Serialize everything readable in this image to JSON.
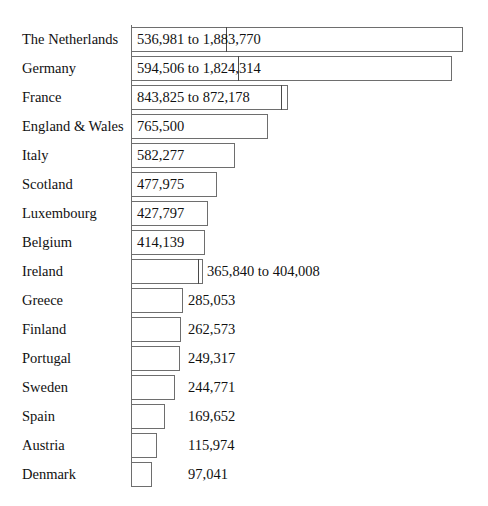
{
  "chart_data": {
    "type": "bar",
    "orientation": "horizontal",
    "title": "",
    "subtitle": "",
    "xlabel": "",
    "ylabel": "",
    "grid": false,
    "legend": null,
    "axis": {
      "category_axis": "left",
      "tick_labels": [],
      "value_axis_visible": false
    },
    "note": "Each row is a country. Some rows encode a range (lower to upper bound) drawn as an inner divider line plus an outer bar edge; others encode one single value.",
    "categories": [
      "The Netherlands",
      "Germany",
      "France",
      "England & Wales",
      "Italy",
      "Scotland",
      "Luxembourg",
      "Belgium",
      "Ireland",
      "Greece",
      "Finland",
      "Portugal",
      "Sweden",
      "Spain",
      "Austria",
      "Denmark"
    ],
    "values": [
      1883770,
      1824314,
      872178,
      765500,
      582277,
      477975,
      427797,
      414139,
      404008,
      285053,
      262573,
      249317,
      244771,
      169652,
      115974,
      97041
    ],
    "values_lower": [
      536981,
      594506,
      843825,
      null,
      null,
      null,
      null,
      null,
      365840,
      null,
      null,
      null,
      null,
      null,
      null,
      null
    ],
    "series": [
      {
        "name": "Upper bound / value",
        "values": [
          1883770,
          1824314,
          872178,
          765500,
          582277,
          477975,
          427797,
          414139,
          404008,
          285053,
          262573,
          249317,
          244771,
          169652,
          115974,
          97041
        ]
      },
      {
        "name": "Lower bound",
        "values": [
          536981,
          594506,
          843825,
          null,
          null,
          null,
          null,
          null,
          365840,
          null,
          null,
          null,
          null,
          null,
          null,
          null
        ]
      }
    ]
  },
  "rows": [
    {
      "country": "The Netherlands",
      "label": "536,981 to 1,883,770",
      "label_position": "inside",
      "is_range": true,
      "outer_px": 332,
      "inner_px": 95,
      "label_left_px": 137
    },
    {
      "country": "Germany",
      "label": "594,506 to 1,824,314",
      "label_position": "inside",
      "is_range": true,
      "outer_px": 321,
      "inner_px": 107,
      "label_left_px": 137
    },
    {
      "country": "France",
      "label": "843,825 to 872,178",
      "label_position": "inside",
      "is_range": true,
      "outer_px": 157,
      "inner_px": 150,
      "label_left_px": 137
    },
    {
      "country": "England & Wales",
      "label": "765,500",
      "label_position": "inside",
      "is_range": false,
      "outer_px": 137,
      "inner_px": null,
      "label_left_px": 137
    },
    {
      "country": "Italy",
      "label": "582,277",
      "label_position": "inside",
      "is_range": false,
      "outer_px": 104,
      "inner_px": null,
      "label_left_px": 137
    },
    {
      "country": "Scotland",
      "label": "477,975",
      "label_position": "inside",
      "is_range": false,
      "outer_px": 86,
      "inner_px": null,
      "label_left_px": 137
    },
    {
      "country": "Luxembourg",
      "label": "427,797",
      "label_position": "inside",
      "is_range": false,
      "outer_px": 77,
      "inner_px": null,
      "label_left_px": 137
    },
    {
      "country": "Belgium",
      "label": "414,139",
      "label_position": "inside",
      "is_range": false,
      "outer_px": 74,
      "inner_px": null,
      "label_left_px": 137
    },
    {
      "country": "Ireland",
      "label": "365,840 to 404,008",
      "label_position": "outside",
      "is_range": true,
      "outer_px": 72,
      "inner_px": 67,
      "label_left_px": 207
    },
    {
      "country": "Greece",
      "label": "285,053",
      "label_position": "outside",
      "is_range": false,
      "outer_px": 52,
      "inner_px": null,
      "label_left_px": 188
    },
    {
      "country": "Finland",
      "label": "262,573",
      "label_position": "outside",
      "is_range": false,
      "outer_px": 50,
      "inner_px": null,
      "label_left_px": 188
    },
    {
      "country": "Portugal",
      "label": "249,317",
      "label_position": "outside",
      "is_range": false,
      "outer_px": 49,
      "inner_px": null,
      "label_left_px": 188
    },
    {
      "country": "Sweden",
      "label": "244,771",
      "label_position": "outside",
      "is_range": false,
      "outer_px": 44,
      "inner_px": null,
      "label_left_px": 188
    },
    {
      "country": "Spain",
      "label": "169,652",
      "label_position": "outside",
      "is_range": false,
      "outer_px": 34,
      "inner_px": null,
      "label_left_px": 188
    },
    {
      "country": "Austria",
      "label": "115,974",
      "label_position": "outside",
      "is_range": false,
      "outer_px": 26,
      "inner_px": null,
      "label_left_px": 188
    },
    {
      "country": "Denmark",
      "label": "97,041",
      "label_position": "outside",
      "is_range": false,
      "outer_px": 21,
      "inner_px": null,
      "label_left_px": 188
    }
  ],
  "layout": {
    "axis_left_px": 131,
    "first_row_top_px": 25,
    "row_height_px": 29,
    "bar_height_px": 25
  },
  "colors": {
    "background": "#ffffff",
    "bar_fill": "#ffffff",
    "bar_stroke": "#6e6e6e",
    "axis": "#6b6b6b",
    "text": "#111111"
  }
}
